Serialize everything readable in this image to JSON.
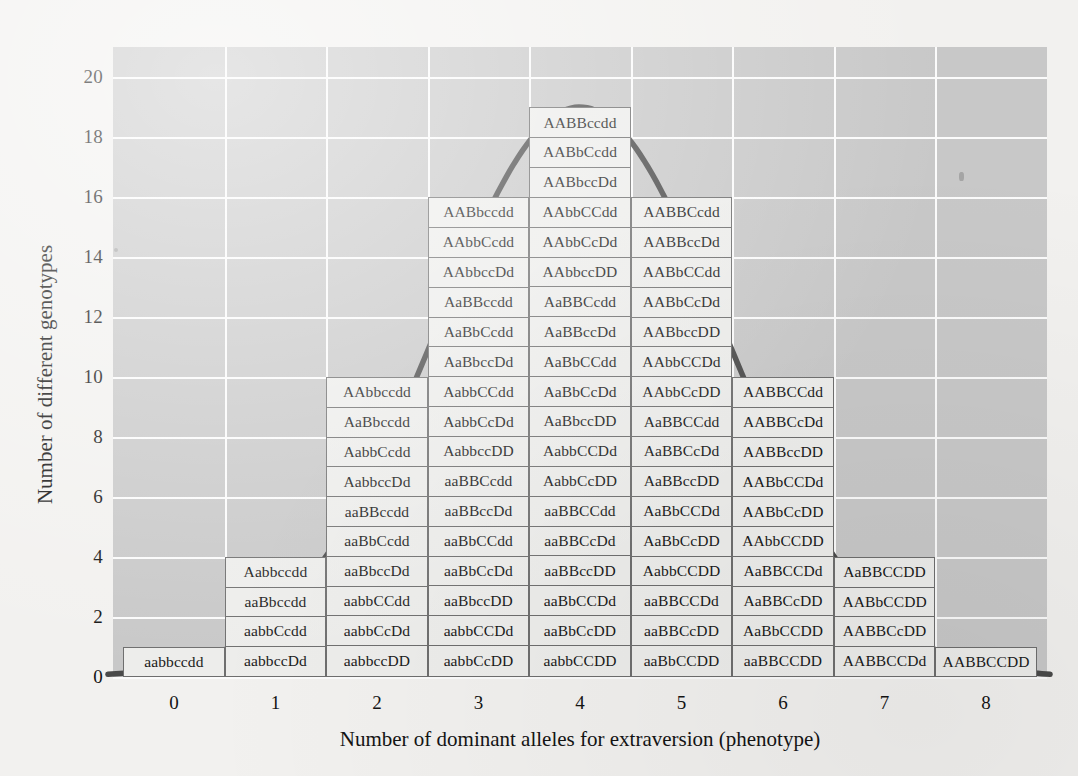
{
  "chart_data": {
    "type": "bar",
    "title": "",
    "xlabel": "Number of dominant alleles for extraversion (phenotype)",
    "ylabel": "Number of different genotypes",
    "xticks": [
      "0",
      "1",
      "2",
      "3",
      "4",
      "5",
      "6",
      "7",
      "8"
    ],
    "yticks": [
      "0",
      "2",
      "4",
      "6",
      "8",
      "10",
      "12",
      "14",
      "16",
      "18",
      "20"
    ],
    "xlim": [
      -0.6,
      8.6
    ],
    "ylim": [
      0,
      21
    ],
    "grid": true,
    "legend": null,
    "categories": [
      0,
      1,
      2,
      3,
      4,
      5,
      6,
      7,
      8
    ],
    "values": [
      1,
      4,
      10,
      16,
      19,
      16,
      10,
      4,
      1
    ],
    "overlay_curve": "normal distribution bell curve",
    "curve_color": "#4a4a4a",
    "plot_background": "#c8c8c8",
    "gridline_color": "#fbfbfb",
    "cell_fill": "#ededeb",
    "cell_border": "#6e6e6e",
    "columns": [
      {
        "x": 0,
        "count": 1,
        "genotypes": [
          "aabbccdd"
        ]
      },
      {
        "x": 1,
        "count": 4,
        "genotypes": [
          "aabbccDd",
          "aabbCcdd",
          "aaBbccdd",
          "Aabbccdd"
        ]
      },
      {
        "x": 2,
        "count": 10,
        "genotypes": [
          "aabbccDD",
          "aabbCcDd",
          "aabbCCdd",
          "aaBbccDd",
          "aaBbCcdd",
          "aaBBccdd",
          "AabbccDd",
          "AabbCcdd",
          "AaBbccdd",
          "AAbbccdd"
        ]
      },
      {
        "x": 3,
        "count": 16,
        "genotypes": [
          "aabbCcDD",
          "aabbCCDd",
          "aaBbccDD",
          "aaBbCcDd",
          "aaBbCCdd",
          "aaBBccDd",
          "aaBBCcdd",
          "AabbccDD",
          "AabbCcDd",
          "AabbCCdd",
          "AaBbccDd",
          "AaBbCcdd",
          "AaBBccdd",
          "AAbbccDd",
          "AAbbCcdd",
          "AABbccdd"
        ]
      },
      {
        "x": 4,
        "count": 19,
        "genotypes": [
          "aabbCCDD",
          "aaBbCcDD",
          "aaBbCCDd",
          "aaBBccDD",
          "aaBBCcDd",
          "aaBBCCdd",
          "AabbCcDD",
          "AabbCCDd",
          "AaBbccDD",
          "AaBbCcDd",
          "AaBbCCdd",
          "AaBBccDd",
          "AaBBCcdd",
          "AAbbccDD",
          "AAbbCcDd",
          "AAbbCCdd",
          "AABbccDd",
          "AABbCcdd",
          "AABBccdd"
        ]
      },
      {
        "x": 5,
        "count": 16,
        "genotypes": [
          "aaBbCCDD",
          "aaBBCcDD",
          "aaBBCCDd",
          "AabbCCDD",
          "AaBbCcDD",
          "AaBbCCDd",
          "AaBBccDD",
          "AaBBCcDd",
          "AaBBCCdd",
          "AAbbCcDD",
          "AAbbCCDd",
          "AABbccDD",
          "AABbCcDd",
          "AABbCCdd",
          "AABBccDd",
          "AABBCcdd"
        ]
      },
      {
        "x": 6,
        "count": 10,
        "genotypes": [
          "aaBBCCDD",
          "AaBbCCDD",
          "AaBBCcDD",
          "AaBBCCDd",
          "AAbbCCDD",
          "AABbCcDD",
          "AABbCCDd",
          "AABBccDD",
          "AABBCcDd",
          "AABBCCdd"
        ]
      },
      {
        "x": 7,
        "count": 4,
        "genotypes": [
          "AABBCCDd",
          "AABBCcDD",
          "AABbCCDD",
          "AaBBCCDD"
        ]
      },
      {
        "x": 8,
        "count": 1,
        "genotypes": [
          "AABBCCDD"
        ]
      }
    ]
  }
}
